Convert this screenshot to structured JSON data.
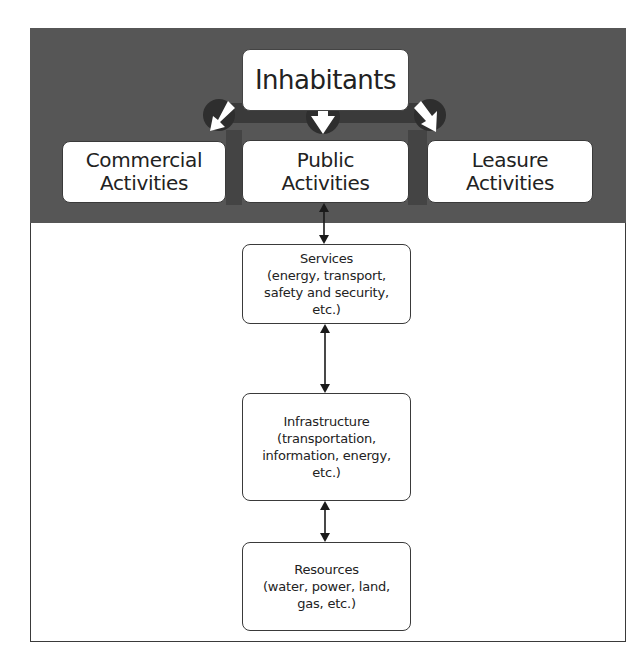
{
  "diagram": {
    "type": "layered-flow",
    "colors": {
      "band_background": "#565656",
      "circle": "#2e2e2e",
      "box_fill": "#ffffff",
      "box_border": "#3a3a3a",
      "text": "#222222"
    },
    "top": {
      "label": "Inhabitants"
    },
    "activities": [
      {
        "line1": "Commercial",
        "line2": "Activities"
      },
      {
        "line1": "Public",
        "line2": "Activities"
      },
      {
        "line1": "Leasure",
        "line2": "Activities"
      }
    ],
    "layers": [
      {
        "title": "Services",
        "lines": [
          "(energy, transport,",
          "safety and security,",
          "etc.)"
        ]
      },
      {
        "title": "Infrastructure",
        "lines": [
          "(transportation,",
          "information, energy,",
          "etc.)"
        ]
      },
      {
        "title": "Resources",
        "lines": [
          "(water, power, land,",
          "gas, etc.)"
        ]
      }
    ],
    "edges": [
      {
        "from": "Inhabitants",
        "to": "Commercial Activities",
        "direction": "one-way"
      },
      {
        "from": "Inhabitants",
        "to": "Public Activities",
        "direction": "one-way"
      },
      {
        "from": "Inhabitants",
        "to": "Leasure Activities",
        "direction": "one-way"
      },
      {
        "from": "Public Activities",
        "to": "Services",
        "direction": "bidirectional"
      },
      {
        "from": "Services",
        "to": "Infrastructure",
        "direction": "bidirectional"
      },
      {
        "from": "Infrastructure",
        "to": "Resources",
        "direction": "bidirectional"
      }
    ]
  }
}
